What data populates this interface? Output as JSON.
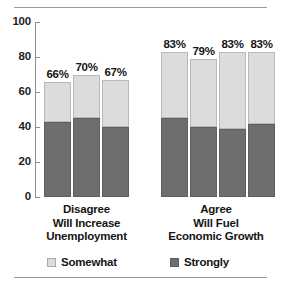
{
  "chart_data": {
    "type": "bar",
    "stacked": true,
    "title": "",
    "subtitle": "",
    "xlabel": "",
    "ylabel": "",
    "ylim": [
      0,
      100
    ],
    "yticks": [
      "0",
      "20",
      "40",
      "60",
      "80",
      "100"
    ],
    "grid": false,
    "legend_position": "bottom",
    "legend": [
      "Somewhat",
      "Strongly"
    ],
    "series": [
      {
        "name": "Strongly",
        "color": "#6e6e6e",
        "values": [
          43,
          45,
          40,
          45,
          40,
          39,
          42
        ]
      },
      {
        "name": "Somewhat",
        "color": "#dcdcdc",
        "values": [
          23,
          25,
          27,
          38,
          39,
          44,
          41
        ]
      }
    ],
    "bar_total_labels": [
      "66%",
      "70%",
      "67%",
      "83%",
      "79%",
      "83%",
      "83%"
    ],
    "groups": [
      {
        "caption": [
          "Disagree",
          "Will Increase",
          "Unemployment"
        ],
        "bar_count": 3
      },
      {
        "caption": [
          "Agree",
          "Will Fuel",
          "Economic Growth"
        ],
        "bar_count": 4
      }
    ]
  },
  "axis": {
    "y_tick_100": "100",
    "y_tick_80": "80",
    "y_tick_60": "60",
    "y_tick_40": "40",
    "y_tick_20": "20",
    "y_tick_0": "0"
  },
  "bars": [
    {
      "label": "66%",
      "total": 66,
      "strongly": 43,
      "somewhat": 23
    },
    {
      "label": "70%",
      "total": 70,
      "strongly": 45,
      "somewhat": 25
    },
    {
      "label": "67%",
      "total": 67,
      "strongly": 40,
      "somewhat": 27
    },
    {
      "label": "83%",
      "total": 83,
      "strongly": 45,
      "somewhat": 38
    },
    {
      "label": "79%",
      "total": 79,
      "strongly": 40,
      "somewhat": 39
    },
    {
      "label": "83%",
      "total": 83,
      "strongly": 39,
      "somewhat": 44
    },
    {
      "label": "83%",
      "total": 83,
      "strongly": 42,
      "somewhat": 41
    }
  ],
  "groups": {
    "left": {
      "line1": "Disagree",
      "line2": "Will Increase",
      "line3": "Unemployment"
    },
    "right": {
      "line1": "Agree",
      "line2": "Will Fuel",
      "line3": "Economic Growth"
    }
  },
  "legend": {
    "somewhat": "Somewhat",
    "strongly": "Strongly"
  },
  "colors": {
    "somewhat": "#dcdcdc",
    "strongly": "#6e6e6e",
    "axis": "#8d8d8d",
    "rule": "#9a9a9a",
    "text": "#151515"
  }
}
